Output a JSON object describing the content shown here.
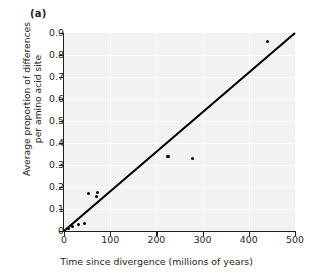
{
  "figure": {
    "panel_label": "(a)",
    "background_color": "#f2f2f2",
    "point_color": "#000000",
    "line_color": "#000000",
    "grid_color": "#ffffff"
  },
  "chart_data": {
    "type": "scatter",
    "title": "(a)",
    "xlabel": "Time since divergence (millions of years)",
    "ylabel": "Average proportion of differences per amino acid site",
    "ylabel_line1": "Average proportion of differences",
    "ylabel_line2": "per amino acid site",
    "xlim": [
      0,
      500
    ],
    "ylim": [
      0,
      0.9
    ],
    "xticks": [
      0,
      100,
      200,
      300,
      400,
      500
    ],
    "xtick_labels": [
      "0",
      "100",
      "200",
      "300",
      "400",
      "500"
    ],
    "yticks": [
      0,
      0.1,
      0.2,
      0.3,
      0.4,
      0.5,
      0.6,
      0.7,
      0.8,
      0.9
    ],
    "ytick_labels": [
      "0",
      "0.1",
      "0.2",
      "0.3",
      "0.4",
      "0.5",
      "0.6",
      "0.7",
      "0.8",
      "0.9"
    ],
    "grid": true,
    "legend": null,
    "points": [
      {
        "x": 10,
        "y": 0.01
      },
      {
        "x": 19,
        "y": 0.02
      },
      {
        "x": 31,
        "y": 0.03
      },
      {
        "x": 44,
        "y": 0.035
      },
      {
        "x": 53,
        "y": 0.17
      },
      {
        "x": 71,
        "y": 0.155
      },
      {
        "x": 73,
        "y": 0.175
      },
      {
        "x": 225,
        "y": 0.34
      },
      {
        "x": 278,
        "y": 0.33
      },
      {
        "x": 440,
        "y": 0.86
      }
    ],
    "series": [
      {
        "name": "observed divergence",
        "x": [
          10,
          19,
          31,
          44,
          53,
          71,
          73,
          225,
          278,
          440
        ],
        "values": [
          0.01,
          0.02,
          0.03,
          0.035,
          0.17,
          0.155,
          0.175,
          0.34,
          0.33,
          0.86
        ]
      }
    ],
    "trendline": {
      "name": "fitted regression line",
      "x_start": 0,
      "y_start": 0.0,
      "x_end": 500,
      "y_end": 0.9,
      "slope": 0.0018,
      "intercept": 0.0
    }
  }
}
